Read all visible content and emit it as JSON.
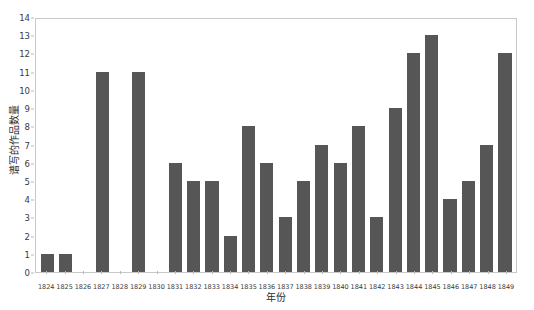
{
  "chart_data": {
    "type": "bar",
    "title": "",
    "xlabel": "年份",
    "ylabel": "谱写的作品数量",
    "ylim": [
      0,
      14
    ],
    "yticks": [
      0,
      1,
      2,
      3,
      4,
      5,
      6,
      7,
      8,
      9,
      10,
      11,
      12,
      13,
      14
    ],
    "grid": false,
    "legend": null,
    "bar_color": "#565656",
    "plot_border_color": "#c9c9c9",
    "categories": [
      "1824",
      "1825",
      "1826",
      "1827",
      "1828",
      "1829",
      "1830",
      "1831",
      "1832",
      "1833",
      "1834",
      "1835",
      "1836",
      "1837",
      "1838",
      "1839",
      "1840",
      "1841",
      "1842",
      "1843",
      "1844",
      "1845",
      "1846",
      "1847",
      "1848",
      "1849"
    ],
    "values": [
      1,
      1,
      0,
      11,
      0,
      11,
      0,
      6,
      5,
      5,
      2,
      8,
      6,
      3,
      5,
      7,
      6,
      8,
      3,
      9,
      12,
      13,
      4,
      5,
      7,
      12
    ]
  }
}
